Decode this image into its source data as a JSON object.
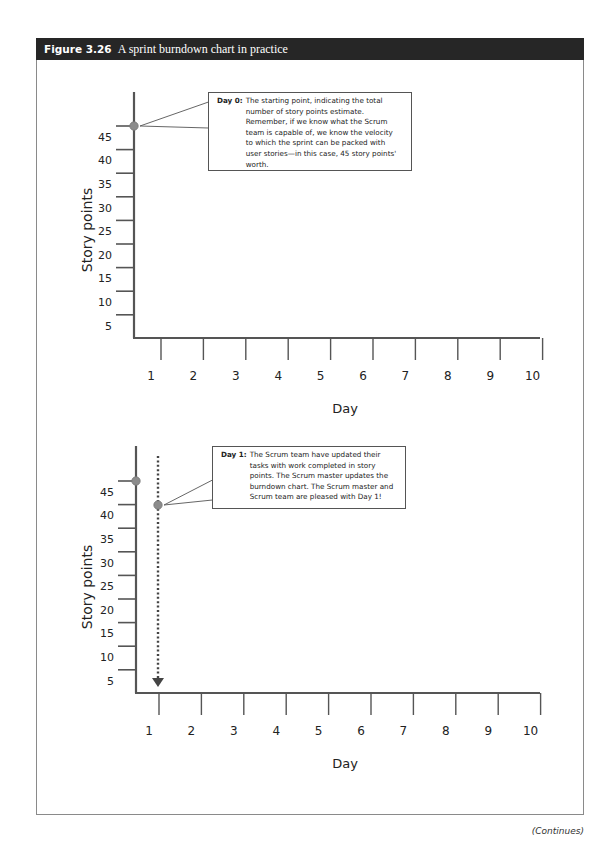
{
  "figure": {
    "number": "Figure 3.26",
    "title": "A sprint burndown chart in practice",
    "footer": "(Continues)"
  },
  "colors": {
    "header_bg": "#262626",
    "axis": "#555555",
    "point": "#8c8c8c",
    "callout_border": "#555555"
  },
  "chart_data": [
    {
      "type": "line",
      "title": "Sprint burndown — Day 0",
      "xlabel": "Day",
      "ylabel": "Story points",
      "x_ticks": [
        "1",
        "2",
        "3",
        "4",
        "5",
        "6",
        "7",
        "8",
        "9",
        "10"
      ],
      "y_ticks": [
        "45",
        "40",
        "35",
        "30",
        "25",
        "20",
        "15",
        "10",
        "5"
      ],
      "xlim": [
        0,
        10
      ],
      "ylim": [
        0,
        50
      ],
      "grid": false,
      "series": [
        {
          "name": "Remaining story points",
          "points": [
            {
              "x": 0,
              "y": 45
            }
          ]
        }
      ],
      "annotations": [
        {
          "label": "Day 0:",
          "text": "The starting point, indicating the total number of story points estimate. Remember, if we know what the Scrum team is capable of, we know the velocity to which the sprint can be packed with user stories—in this case, 45 story points' worth.",
          "lines": [
            "The starting point, indicating the total",
            "number of story points estimate.",
            "Remember, if we know what the Scrum",
            "team is capable of, we know the velocity",
            "to which the sprint can be packed with",
            "user stories—in this case, 45 story points'",
            "worth."
          ],
          "points_to": {
            "x": 0,
            "y": 45
          }
        }
      ]
    },
    {
      "type": "line",
      "title": "Sprint burndown — Day 1",
      "xlabel": "Day",
      "ylabel": "Story points",
      "x_ticks": [
        "1",
        "2",
        "3",
        "4",
        "5",
        "6",
        "7",
        "8",
        "9",
        "10"
      ],
      "y_ticks": [
        "45",
        "40",
        "35",
        "30",
        "25",
        "20",
        "15",
        "10",
        "5"
      ],
      "xlim": [
        0,
        10
      ],
      "ylim": [
        0,
        50
      ],
      "grid": false,
      "series": [
        {
          "name": "Remaining story points",
          "points": [
            {
              "x": 0,
              "y": 45
            },
            {
              "x": 1,
              "y": 42
            }
          ]
        }
      ],
      "reference_lines": [
        {
          "type": "dotted-arrow-down",
          "x": 1,
          "from_y": 48,
          "to_y": 0
        }
      ],
      "annotations": [
        {
          "label": "Day 1:",
          "text": "The Scrum team have updated their tasks with work completed in story points. The Scrum master updates the burndown chart. The Scrum master and Scrum team are pleased with Day 1!",
          "lines": [
            "The Scrum team have updated their",
            "tasks with work completed in story",
            "points. The Scrum master updates the",
            "burndown chart. The Scrum master and",
            "Scrum team are pleased with Day 1!"
          ],
          "points_to": {
            "x": 1,
            "y": 42
          }
        }
      ]
    }
  ]
}
